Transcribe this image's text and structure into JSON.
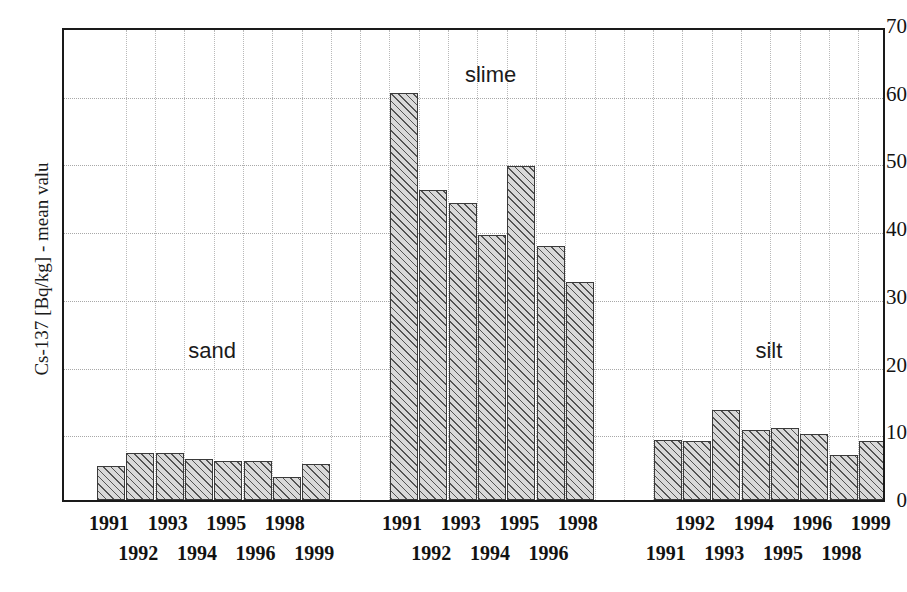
{
  "chart_data": {
    "type": "bar",
    "title": "",
    "xlabel": "",
    "ylabel": "Cs-137 [Bq/kg] - mean valu",
    "ylim": [
      0,
      70
    ],
    "ytick_labels": [
      "0",
      "10",
      "20",
      "30",
      "40",
      "50",
      "60",
      "70"
    ],
    "ytick_values": [
      0,
      10,
      20,
      30,
      40,
      50,
      60,
      70
    ],
    "grid": true,
    "legend": "none",
    "groups": [
      {
        "name": "sand",
        "caption": "sand",
        "categories": [
          "1991",
          "1992",
          "1993",
          "1994",
          "1995",
          "1996",
          "1998",
          "1999"
        ],
        "values": [
          5.0,
          7.0,
          7.0,
          6.1,
          5.8,
          5.7,
          3.4,
          5.3
        ]
      },
      {
        "name": "slime",
        "caption": "slime",
        "categories": [
          "1991",
          "1992",
          "1993",
          "1994",
          "1995",
          "1996",
          "1998"
        ],
        "values": [
          60.1,
          45.8,
          43.9,
          39.2,
          49.3,
          37.5,
          32.2
        ]
      },
      {
        "name": "silt",
        "caption": "silt",
        "categories": [
          "1991",
          "1992",
          "1993",
          "1994",
          "1995",
          "1996",
          "1998",
          "1999"
        ],
        "values": [
          8.8,
          8.7,
          13.3,
          10.4,
          10.7,
          9.8,
          6.6,
          8.7
        ]
      }
    ]
  },
  "colors": {
    "bar_fill": "#d9d9d9",
    "bar_edge": "#3a3a3a",
    "axis": "#1a1a1a",
    "grid": "#b0b0b0",
    "text": "#121212",
    "background": "#ffffff"
  }
}
